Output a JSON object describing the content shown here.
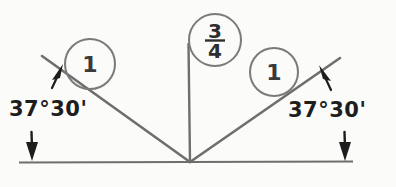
{
  "diagram": {
    "type": "engineering-drawing",
    "background_color": "#fbfbfa",
    "line_color": "#6e6e6e",
    "arrow_color": "#1d1d1d",
    "text_color": "#1d1d1d",
    "baseline": {
      "label": "baseline",
      "x1": 20,
      "y1": 162,
      "x2": 352,
      "y2": 161
    },
    "vertex": {
      "x": 190,
      "y": 162
    },
    "legs": [
      {
        "name": "left-leg",
        "x1": 42,
        "y1": 56,
        "x2": 190,
        "y2": 162
      },
      {
        "name": "right-leg",
        "x1": 340,
        "y1": 58,
        "x2": 190,
        "y2": 162
      },
      {
        "name": "center-vertical",
        "x1": 188,
        "y1": 46,
        "x2": 190,
        "y2": 162
      }
    ],
    "balloons": [
      {
        "name": "left-dimension-balloon",
        "value": "1",
        "cx": 90,
        "cy": 64,
        "r": 25
      },
      {
        "name": "center-dimension-balloon",
        "value": "3/4",
        "numerator": "3",
        "denominator": "4",
        "cx": 215,
        "cy": 40,
        "r": 26
      },
      {
        "name": "right-dimension-balloon",
        "value": "1",
        "cx": 274,
        "cy": 72,
        "r": 24
      }
    ],
    "angle_labels": [
      {
        "name": "angle-label-left",
        "text": "37°30'",
        "degrees": 37,
        "minutes": 30
      },
      {
        "name": "angle-label-right",
        "text": "37°30'",
        "degrees": 37,
        "minutes": 30
      }
    ],
    "arrows": [
      {
        "name": "left-upper-arrow",
        "direction": "up-right",
        "tip_x": 62,
        "tip_y": 67
      },
      {
        "name": "left-lower-arrow",
        "direction": "down",
        "tip_x": 32,
        "tip_y": 160
      },
      {
        "name": "right-upper-arrow",
        "direction": "up-left",
        "tip_x": 320,
        "tip_y": 69
      },
      {
        "name": "right-lower-arrow",
        "direction": "down",
        "tip_x": 345,
        "tip_y": 160
      }
    ]
  }
}
